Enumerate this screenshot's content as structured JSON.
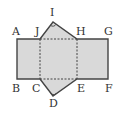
{
  "diagram": {
    "type": "net-of-triangular-prism",
    "colors": {
      "fill": "#d9d9d9",
      "stroke": "#444444",
      "background": "#ffffff"
    },
    "points": {
      "A": "A",
      "B": "B",
      "C": "C",
      "D": "D",
      "E": "E",
      "F": "F",
      "G": "G",
      "H": "H",
      "I": "I",
      "J": "J"
    },
    "right_angle_marks": [
      "I",
      "D"
    ],
    "dashed_edges": [
      "JC",
      "HE",
      "JH",
      "CE"
    ]
  }
}
